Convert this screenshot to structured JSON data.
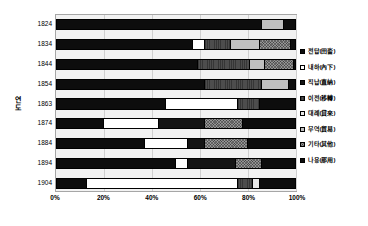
{
  "chart_data": {
    "type": "bar",
    "orientation": "horizontal",
    "stacked": true,
    "normalized": true,
    "title": "",
    "xlabel": "",
    "ylabel": "연도",
    "xlim": [
      0,
      100
    ],
    "xticks": [
      "0%",
      "20%",
      "40%",
      "60%",
      "80%",
      "100%"
    ],
    "xtick_values": [
      0,
      20,
      40,
      60,
      80,
      100
    ],
    "grid": true,
    "legend_position": "right",
    "categories": [
      "1824",
      "1834",
      "1844",
      "1854",
      "1863",
      "1874",
      "1884",
      "1894",
      "1904"
    ],
    "series": [
      {
        "name": "전답(田畓)",
        "key": "jeondap",
        "color": "#0d0d0d",
        "pattern": "solid",
        "values": [
          86,
          57,
          59,
          62,
          46,
          20,
          37,
          50,
          13
        ]
      },
      {
        "name": "내하(內下)",
        "key": "naeha",
        "color": "#ffffff",
        "pattern": "solid",
        "values": [
          0,
          5,
          0,
          0,
          30,
          23,
          18,
          5,
          63
        ]
      },
      {
        "name": "직납(直納)",
        "key": "jiknap",
        "color": "#141414",
        "pattern": "solid",
        "values": [
          0,
          0,
          0,
          0,
          0,
          19,
          7,
          20,
          0
        ]
      },
      {
        "name": "이전(移轉)",
        "key": "ijeon",
        "color": "#4d4d4d",
        "pattern": "hatch",
        "values": [
          0,
          11,
          22,
          24,
          9,
          0,
          0,
          0,
          6
        ]
      },
      {
        "name": "대례(貸來)",
        "key": "daerae",
        "color": "#e8e8e8",
        "pattern": "solid",
        "values": [
          0,
          0,
          0,
          0,
          0,
          0,
          0,
          0,
          3
        ]
      },
      {
        "name": "무역(貿易)",
        "key": "muyeok",
        "color": "#bfbfbf",
        "pattern": "solid",
        "values": [
          9,
          12,
          6,
          11,
          0,
          0,
          0,
          0,
          0
        ]
      },
      {
        "name": "기타(其他)",
        "key": "gita",
        "color": "#949494",
        "pattern": "dots",
        "values": [
          0,
          13,
          12,
          0,
          0,
          16,
          18,
          11,
          0
        ]
      },
      {
        "name": "나용(那用)",
        "key": "nayong",
        "color": "#0d0d0d",
        "pattern": "solid",
        "values": [
          5,
          2,
          1,
          3,
          15,
          22,
          20,
          14,
          15
        ]
      }
    ]
  },
  "axis": {
    "y_title": "연도",
    "y_title_chars": [
      "연",
      "도"
    ]
  }
}
